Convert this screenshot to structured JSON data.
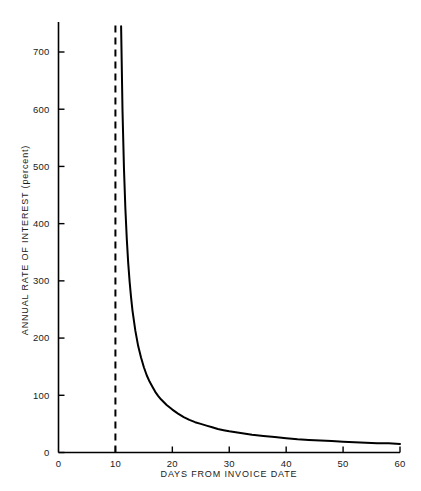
{
  "chart_data": {
    "type": "line",
    "title": "",
    "subtitle": "",
    "xlabel": "DAYS FROM INVOICE DATE",
    "ylabel": "ANNUAL RATE OF INTEREST (percent)",
    "xlim": [
      0,
      60
    ],
    "ylim": [
      0,
      745
    ],
    "grid": false,
    "legend": null,
    "xticks": [
      0,
      10,
      20,
      30,
      40,
      50,
      60
    ],
    "xtick_labels": [
      "0",
      "10",
      "20",
      "30",
      "40",
      "50",
      "60"
    ],
    "yticks": [
      0,
      100,
      200,
      300,
      400,
      500,
      600,
      700
    ],
    "ytick_labels": [
      "0",
      "100",
      "200",
      "300",
      "400",
      "500",
      "600",
      "700"
    ],
    "series": [
      {
        "name": "Annual rate of interest",
        "style": "solid",
        "color": "#000000",
        "width": 2.0,
        "x": [
          11,
          11.25,
          11.5,
          11.75,
          12,
          12.25,
          12.5,
          12.75,
          13,
          13.5,
          14,
          14.5,
          15,
          15.5,
          16,
          16.5,
          17,
          17.5,
          18,
          19,
          20,
          21,
          22,
          23,
          24,
          25,
          26,
          27,
          28,
          29,
          30,
          32,
          34,
          36,
          38,
          40,
          42,
          44,
          46,
          48,
          50,
          52,
          54,
          56,
          58,
          60
        ],
        "y": [
          745,
          596,
          497,
          426,
          373,
          331,
          298,
          271,
          248,
          213,
          186,
          166,
          149,
          135,
          124,
          115,
          106,
          99,
          93,
          83,
          75,
          68,
          62,
          57,
          53,
          50,
          47,
          44,
          41,
          39,
          37,
          34,
          31,
          29,
          27,
          25,
          23,
          22,
          21,
          20,
          19,
          18,
          17,
          16,
          16,
          15
        ]
      },
      {
        "name": "Discount period boundary",
        "style": "dashed",
        "color": "#000000",
        "width": 2.0,
        "x": [
          10,
          10
        ],
        "y": [
          0,
          760
        ]
      }
    ],
    "annotations": [
      {
        "text": "dashed vertical reference line at day 10 (end of discount period)",
        "x": 10
      }
    ]
  },
  "axes": {
    "x_axis_name": "DAYS FROM INVOICE DATE",
    "y_axis_name": "ANNUAL RATE OF INTEREST (percent)"
  }
}
